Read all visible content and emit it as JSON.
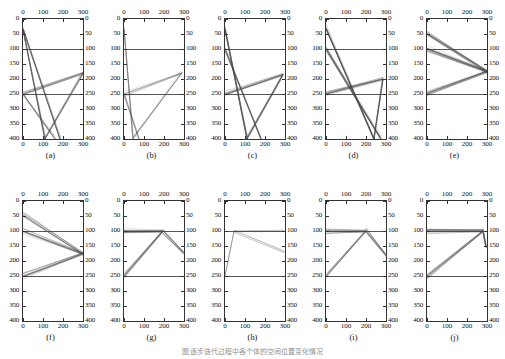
{
  "figure": {
    "caption": "图 逐步迭代过程中各个体的空间位置变化情况",
    "panel_count": 10,
    "layout": "2 rows × 5 columns"
  },
  "axes": {
    "x_ticks": [
      "0",
      "100",
      "200",
      "300"
    ],
    "x_tick_values": [
      0,
      100,
      200,
      300
    ],
    "y_ticks": [
      "0",
      "50",
      "100",
      "150",
      "200",
      "250",
      "300",
      "350",
      "400"
    ],
    "y_tick_values": [
      0,
      50,
      100,
      150,
      200,
      250,
      300,
      350,
      400
    ],
    "xlim": [
      0,
      300
    ],
    "ylim": [
      400,
      0
    ],
    "y_inverted": true,
    "top_axis_labeled": true,
    "bottom_axis_labeled": true,
    "left_axis_labeled": true,
    "right_axis_labeled": true,
    "reference_lines_y": [
      100,
      250
    ],
    "reference_line_color": "#555555",
    "line_color": "#4a4a4a",
    "grid": false,
    "legend": false
  },
  "chart_data": {
    "type": "line",
    "title": "",
    "subtitle": "",
    "xlabel": "",
    "ylabel": "",
    "xlim": [
      0,
      300
    ],
    "ylim": [
      400,
      0
    ],
    "grid": false,
    "legend_position": "none",
    "panels": [
      {
        "label": "(a)",
        "id": "a",
        "line_count": 45,
        "anchors": [
          [
            0,
            35
          ],
          [
            0,
            250
          ],
          [
            110,
            400
          ],
          [
            185,
            400
          ],
          [
            300,
            180
          ]
        ],
        "pattern": "dense crossing X, converging at x=300 y=180 and fanning down to x=110-185 at y=400",
        "series": [
          {
            "name": "bundle-1",
            "x": [
              0,
              110
            ],
            "y": [
              35,
              400
            ]
          },
          {
            "name": "bundle-2",
            "x": [
              0,
              185
            ],
            "y": [
              35,
              400
            ]
          },
          {
            "name": "bundle-3",
            "x": [
              0,
              300
            ],
            "y": [
              250,
              180
            ]
          },
          {
            "name": "bundle-4",
            "x": [
              110,
              300
            ],
            "y": [
              400,
              180
            ]
          },
          {
            "name": "bundle-5",
            "x": [
              0,
              160
            ],
            "y": [
              250,
              400
            ]
          }
        ]
      },
      {
        "label": "(b)",
        "id": "b",
        "line_count": 22,
        "anchors": [
          [
            0,
            35
          ],
          [
            0,
            250
          ],
          [
            45,
            400
          ],
          [
            75,
            400
          ],
          [
            290,
            180
          ]
        ],
        "pattern": "sparse bundle from upper-left plunging to x=45-75 at y=400, plus wedge to x=290 y=180",
        "series": [
          {
            "name": "bundle-1",
            "x": [
              0,
              45
            ],
            "y": [
              35,
              400
            ]
          },
          {
            "name": "bundle-2",
            "x": [
              0,
              290
            ],
            "y": [
              250,
              180
            ]
          },
          {
            "name": "bundle-3",
            "x": [
              45,
              290
            ],
            "y": [
              400,
              180
            ]
          },
          {
            "name": "bundle-4",
            "x": [
              0,
              75
            ],
            "y": [
              250,
              400
            ]
          }
        ]
      },
      {
        "label": "(c)",
        "id": "c",
        "line_count": 48,
        "anchors": [
          [
            0,
            35
          ],
          [
            0,
            100
          ],
          [
            0,
            250
          ],
          [
            110,
            400
          ],
          [
            180,
            400
          ],
          [
            290,
            185
          ]
        ],
        "pattern": "dense crossing X similar to (a), strong vertical band near x=150-180",
        "series": [
          {
            "name": "bundle-1",
            "x": [
              0,
              110
            ],
            "y": [
              35,
              400
            ]
          },
          {
            "name": "bundle-2",
            "x": [
              0,
              180
            ],
            "y": [
              100,
              400
            ]
          },
          {
            "name": "bundle-3",
            "x": [
              0,
              290
            ],
            "y": [
              250,
              185
            ]
          },
          {
            "name": "bundle-4",
            "x": [
              110,
              290
            ],
            "y": [
              400,
              185
            ]
          }
        ]
      },
      {
        "label": "(d)",
        "id": "d",
        "line_count": 52,
        "anchors": [
          [
            0,
            30
          ],
          [
            0,
            100
          ],
          [
            0,
            250
          ],
          [
            240,
            400
          ],
          [
            275,
            400
          ],
          [
            285,
            200
          ],
          [
            300,
            250
          ]
        ],
        "pattern": "dense fan sweeping right-downward to x=240-275 at y=400 with a narrow spike back up at x=285",
        "series": [
          {
            "name": "bundle-1",
            "x": [
              0,
              240
            ],
            "y": [
              30,
              400
            ]
          },
          {
            "name": "bundle-2",
            "x": [
              0,
              275
            ],
            "y": [
              100,
              400
            ]
          },
          {
            "name": "bundle-3",
            "x": [
              0,
              285
            ],
            "y": [
              250,
              200
            ]
          },
          {
            "name": "bundle-4",
            "x": [
              240,
              285
            ],
            "y": [
              400,
              200
            ]
          }
        ]
      },
      {
        "label": "(e)",
        "id": "e",
        "line_count": 46,
        "anchors": [
          [
            0,
            50
          ],
          [
            0,
            100
          ],
          [
            0,
            250
          ],
          [
            300,
            175
          ]
        ],
        "pattern": "clean left-edge fan converging to a single point at x=300 y=175",
        "series": [
          {
            "name": "bundle-1",
            "x": [
              0,
              300
            ],
            "y": [
              50,
              175
            ]
          },
          {
            "name": "bundle-2",
            "x": [
              0,
              300
            ],
            "y": [
              100,
              175
            ]
          },
          {
            "name": "bundle-3",
            "x": [
              0,
              300
            ],
            "y": [
              250,
              175
            ]
          }
        ]
      },
      {
        "label": "(f)",
        "id": "f",
        "line_count": 40,
        "anchors": [
          [
            0,
            45
          ],
          [
            0,
            100
          ],
          [
            0,
            250
          ],
          [
            300,
            175
          ]
        ],
        "pattern": "left-edge fan converging at x=300 y=175, slightly narrower spread than (e)",
        "series": [
          {
            "name": "bundle-1",
            "x": [
              0,
              300
            ],
            "y": [
              45,
              175
            ]
          },
          {
            "name": "bundle-2",
            "x": [
              0,
              300
            ],
            "y": [
              100,
              175
            ]
          },
          {
            "name": "bundle-3",
            "x": [
              0,
              300
            ],
            "y": [
              250,
              175
            ]
          }
        ]
      },
      {
        "label": "(g)",
        "id": "g",
        "line_count": 38,
        "anchors": [
          [
            0,
            100
          ],
          [
            0,
            250
          ],
          [
            195,
            100
          ],
          [
            300,
            175
          ]
        ],
        "pattern": "fan rising from x=0 y=250 to apex near x=195 y=100 then descending to x=300 y=175",
        "series": [
          {
            "name": "bundle-1",
            "x": [
              0,
              195
            ],
            "y": [
              250,
              100
            ]
          },
          {
            "name": "bundle-2",
            "x": [
              0,
              195
            ],
            "y": [
              100,
              100
            ]
          },
          {
            "name": "bundle-3",
            "x": [
              195,
              300
            ],
            "y": [
              100,
              175
            ]
          }
        ]
      },
      {
        "label": "(h)",
        "id": "h",
        "line_count": 8,
        "anchors": [
          [
            0,
            250
          ],
          [
            45,
            100
          ],
          [
            300,
            100
          ],
          [
            300,
            170
          ]
        ],
        "pattern": "very sparse: a few lines from x=0 y=250 up to x=45 y=100, then shallow descent to the right edge",
        "series": [
          {
            "name": "bundle-1",
            "x": [
              0,
              45
            ],
            "y": [
              250,
              100
            ]
          },
          {
            "name": "bundle-2",
            "x": [
              45,
              300
            ],
            "y": [
              100,
              100
            ]
          },
          {
            "name": "bundle-3",
            "x": [
              45,
              300
            ],
            "y": [
              100,
              170
            ]
          }
        ]
      },
      {
        "label": "(i)",
        "id": "i",
        "line_count": 36,
        "anchors": [
          [
            0,
            100
          ],
          [
            0,
            250
          ],
          [
            200,
            100
          ],
          [
            300,
            180
          ]
        ],
        "pattern": "fan from x=0 y=250 to apex near x=200 y=100 then descending to x=300 y=180, similar to (g)",
        "series": [
          {
            "name": "bundle-1",
            "x": [
              0,
              200
            ],
            "y": [
              250,
              100
            ]
          },
          {
            "name": "bundle-2",
            "x": [
              0,
              200
            ],
            "y": [
              100,
              100
            ]
          },
          {
            "name": "bundle-3",
            "x": [
              200,
              300
            ],
            "y": [
              100,
              180
            ]
          }
        ]
      },
      {
        "label": "(j)",
        "id": "j",
        "line_count": 42,
        "anchors": [
          [
            0,
            100
          ],
          [
            0,
            250
          ],
          [
            280,
            100
          ],
          [
            295,
            155
          ]
        ],
        "pattern": "broad fan from the left edge converging at x=280 y=100 with a short hook down to x=295 y=155",
        "series": [
          {
            "name": "bundle-1",
            "x": [
              0,
              280
            ],
            "y": [
              250,
              100
            ]
          },
          {
            "name": "bundle-2",
            "x": [
              0,
              280
            ],
            "y": [
              100,
              100
            ]
          },
          {
            "name": "bundle-3",
            "x": [
              280,
              295
            ],
            "y": [
              100,
              155
            ]
          }
        ]
      }
    ]
  }
}
